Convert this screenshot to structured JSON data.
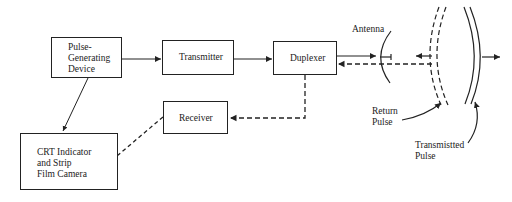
{
  "diagram": {
    "blocks": {
      "pulse_generator": "Pulse-\nGenerating\nDevice",
      "transmitter": "Transmitter",
      "duplexer": "Duplexer",
      "receiver": "Receiver",
      "crt": "CRT Indicator\nand Strip\nFilm Camera"
    },
    "labels": {
      "antenna": "Antenna",
      "return_pulse": "Return\nPulse",
      "transmitted_pulse": "Transmistted\nPulse"
    },
    "connections": [
      {
        "from": "Pulse-Generating Device",
        "to": "Transmitter",
        "style": "solid"
      },
      {
        "from": "Transmitter",
        "to": "Duplexer",
        "style": "solid"
      },
      {
        "from": "Duplexer",
        "to": "Antenna",
        "style": "solid"
      },
      {
        "from": "Antenna",
        "to": "Duplexer",
        "style": "dashed"
      },
      {
        "from": "Duplexer",
        "to": "Receiver",
        "style": "dashed"
      },
      {
        "from": "Receiver",
        "to": "CRT Indicator and Strip Film Camera",
        "style": "dashed"
      },
      {
        "from": "Pulse-Generating Device",
        "to": "CRT Indicator and Strip Film Camera",
        "style": "solid"
      }
    ],
    "colors": {
      "line": "#222222",
      "background": "#ffffff"
    }
  }
}
